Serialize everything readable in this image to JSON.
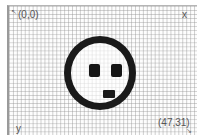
{
  "canvas": {
    "grid_columns": 48,
    "grid_rows": 32,
    "origin_label": "(0,0)",
    "end_label": "(47,31)",
    "x_axis_label": "x",
    "y_axis_label": "y"
  },
  "drawing": {
    "shape": "face",
    "expression": "surprised",
    "stroke_color": "#1a1a1a",
    "grid_color": "#969696",
    "background_color": "#ffffff"
  },
  "icons": {
    "origin_arrow": "↖",
    "end_arrow": "↘"
  }
}
